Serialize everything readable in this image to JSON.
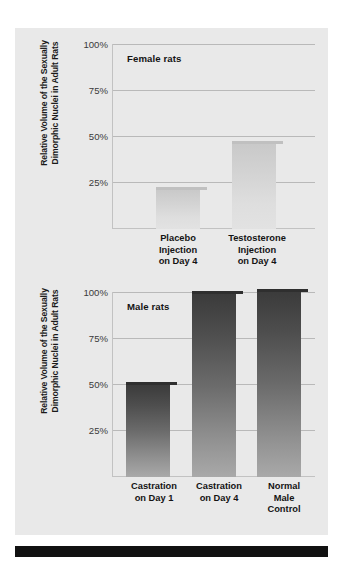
{
  "figure": {
    "background_color": "#e9e9e9",
    "page_color": "#ffffff",
    "rule_color": "#111111"
  },
  "charts": [
    {
      "id": "female",
      "panel_title": "Female rats",
      "y_axis_title_line1": "Relative Volume of the Sexually",
      "y_axis_title_line2": "Dimorphic Nuclei in Adult Rats",
      "ticks": [
        "100%",
        "75%",
        "50%",
        "25%"
      ],
      "bars": [
        {
          "label_line1": "Placebo",
          "label_line2": "Injection",
          "label_line3": "on Day 4",
          "value": 21
        },
        {
          "label_line1": "Testosterone",
          "label_line2": "Injection",
          "label_line3": "on Day 4",
          "value": 46
        }
      ]
    },
    {
      "id": "male",
      "panel_title": "Male rats",
      "y_axis_title_line1": "Relative Volume of the Sexually",
      "y_axis_title_line2": "Dimorphic Nuclei in Adult Rats",
      "ticks": [
        "100%",
        "75%",
        "50%",
        "25%"
      ],
      "bars": [
        {
          "label_line1": "Castration",
          "label_line2": "on Day 1",
          "label_line3": "",
          "value": 50
        },
        {
          "label_line1": "Castration",
          "label_line2": "on Day 4",
          "label_line3": "",
          "value": 99
        },
        {
          "label_line1": "Normal",
          "label_line2": "Male",
          "label_line3": "Control",
          "value": 100
        }
      ]
    }
  ],
  "chart_data": [
    {
      "type": "bar",
      "title": "Female rats",
      "categories": [
        "Placebo Injection on Day 4",
        "Testosterone Injection on Day 4"
      ],
      "values": [
        21,
        46
      ],
      "xlabel": "",
      "ylabel": "Relative Volume of the Sexually Dimorphic Nuclei in Adult Rats",
      "ylim": [
        0,
        100
      ],
      "yticks": [
        25,
        50,
        75,
        100
      ],
      "ytick_labels": [
        "25%",
        "50%",
        "75%",
        "100%"
      ],
      "grid": true,
      "legend": false
    },
    {
      "type": "bar",
      "title": "Male rats",
      "categories": [
        "Castration on Day 1",
        "Castration on Day 4",
        "Normal Male Control"
      ],
      "values": [
        50,
        99,
        100
      ],
      "xlabel": "",
      "ylabel": "Relative Volume of the Sexually Dimorphic Nuclei in Adult Rats",
      "ylim": [
        0,
        100
      ],
      "yticks": [
        25,
        50,
        75,
        100
      ],
      "ytick_labels": [
        "25%",
        "50%",
        "75%",
        "100%"
      ],
      "grid": true,
      "legend": false
    }
  ]
}
